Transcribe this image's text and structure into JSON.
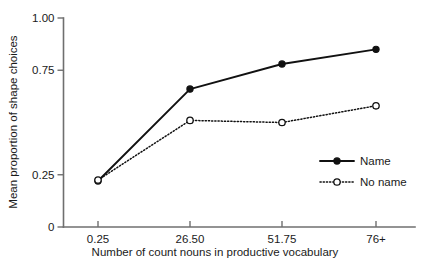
{
  "chart_data": {
    "type": "line",
    "title": "",
    "xlabel": "Number of count nouns in productive vocabulary",
    "ylabel": "Mean proportion of shape choices",
    "categories": [
      "0.25",
      "26.50",
      "51.75",
      "76+"
    ],
    "xtick_labels": [
      "0.25",
      "26.50",
      "51.75",
      "76+"
    ],
    "ytick_labels": [
      "0",
      "0.25",
      "0.75",
      "1.00"
    ],
    "ytick_values": [
      0,
      0.25,
      0.75,
      1.0
    ],
    "ylim": [
      0,
      1.0
    ],
    "grid": false,
    "legend_position": "center-right",
    "series": [
      {
        "name": "Name",
        "line_style": "solid",
        "marker": "filled-circle",
        "color": "#111111",
        "values": [
          0.22,
          0.66,
          0.78,
          0.85
        ]
      },
      {
        "name": "No name",
        "line_style": "dotted",
        "marker": "open-circle",
        "color": "#111111",
        "values": [
          0.225,
          0.51,
          0.5,
          0.58
        ]
      }
    ]
  },
  "legend": {
    "items": [
      {
        "label": "Name"
      },
      {
        "label": "No name"
      }
    ]
  },
  "axes": {
    "y_title": "Mean proportion of shape choices",
    "x_title": "Number of count nouns in productive vocabulary"
  }
}
